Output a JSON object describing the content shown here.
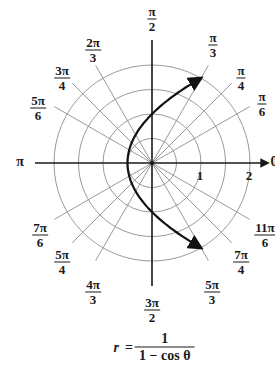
{
  "figure": {
    "center": {
      "x": 152,
      "y": 163
    },
    "unit_px": 49,
    "colors": {
      "grid": "#9a9a9a",
      "axis": "#1a1a1a",
      "curve": "#111111",
      "background": "#ffffff"
    }
  },
  "angle_labels": [
    {
      "id": "pi-over-2",
      "num": "π",
      "den": "2",
      "x": 152,
      "y": 19
    },
    {
      "id": "pi-over-3",
      "num": "π",
      "den": "3",
      "x": 213,
      "y": 45
    },
    {
      "id": "pi-over-4",
      "num": "π",
      "den": "4",
      "x": 241,
      "y": 78
    },
    {
      "id": "pi-over-6",
      "num": "π",
      "den": "6",
      "x": 262,
      "y": 104
    },
    {
      "id": "2pi-over-3",
      "num": "2π",
      "den": "3",
      "x": 93,
      "y": 50
    },
    {
      "id": "3pi-over-4",
      "num": "3π",
      "den": "4",
      "x": 62,
      "y": 78
    },
    {
      "id": "5pi-over-6",
      "num": "5π",
      "den": "6",
      "x": 38,
      "y": 108
    },
    {
      "id": "7pi-over-6",
      "num": "7π",
      "den": "6",
      "x": 40,
      "y": 235
    },
    {
      "id": "5pi-over-4",
      "num": "5π",
      "den": "4",
      "x": 62,
      "y": 262
    },
    {
      "id": "4pi-over-3",
      "num": "4π",
      "den": "3",
      "x": 93,
      "y": 292
    },
    {
      "id": "3pi-over-2",
      "num": "3π",
      "den": "2",
      "x": 152,
      "y": 310
    },
    {
      "id": "5pi-over-3",
      "num": "5π",
      "den": "3",
      "x": 212,
      "y": 292
    },
    {
      "id": "7pi-over-4",
      "num": "7π",
      "den": "4",
      "x": 241,
      "y": 262
    },
    {
      "id": "11pi-over-6",
      "num": "11π",
      "den": "6",
      "x": 265,
      "y": 235
    }
  ],
  "axis_labels": {
    "pi": {
      "text": "π",
      "x": 20,
      "y": 162
    },
    "zero": {
      "text": "0",
      "x": 274,
      "y": 162
    }
  },
  "radial_ticks": [
    {
      "text": "1",
      "x": 200,
      "y": 176
    },
    {
      "text": "2",
      "x": 249,
      "y": 176
    }
  ],
  "equation": {
    "lhs": "r",
    "eq": "=",
    "numerator": "1",
    "denominator": "1 − cos θ"
  },
  "chart_data": {
    "type": "line",
    "title": "",
    "coordinate_system": "polar",
    "equation": "r = 1 / (1 − cos θ)",
    "curve": "parabola (conic, e = 1)",
    "theta_range": [
      "π/3",
      "5π/3"
    ],
    "direction": "arrows at θ = π/3 and θ = 5π/3 (r = 2)",
    "rings": [
      0.5,
      1,
      1.5,
      2
    ],
    "ring_labels": [
      1,
      2
    ],
    "radial_lines_deg": [
      0,
      30,
      45,
      60,
      90,
      120,
      135,
      150,
      180,
      210,
      225,
      240,
      270,
      300,
      315,
      330
    ],
    "sample_points": [
      {
        "theta": "π/3",
        "r": 2
      },
      {
        "theta": "π/2",
        "r": 1
      },
      {
        "theta": "2π/3",
        "r": 0.667
      },
      {
        "theta": "π",
        "r": 0.5
      },
      {
        "theta": "4π/3",
        "r": 0.667
      },
      {
        "theta": "3π/2",
        "r": 1
      },
      {
        "theta": "5π/3",
        "r": 2
      }
    ]
  }
}
